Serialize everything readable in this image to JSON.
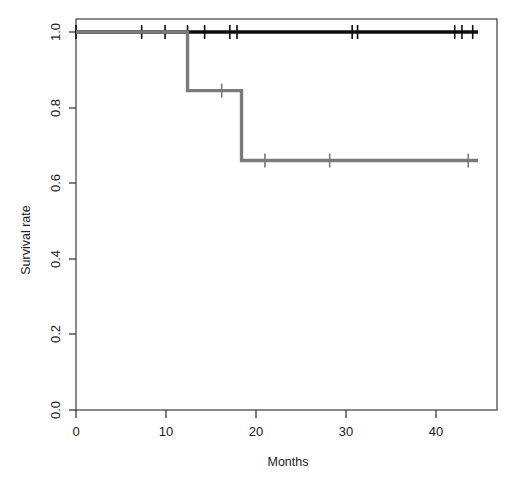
{
  "figure": {
    "background_color": "#ffffff",
    "width": 520,
    "height": 487
  },
  "chart_data": {
    "type": "line",
    "subtype": "kaplan-meier-survival-step",
    "title": "",
    "subtitle": "",
    "xlabel": "Months",
    "ylabel": "Survival rate",
    "xlim": [
      0,
      46.8
    ],
    "ylim": [
      0.0,
      1.0
    ],
    "xticks": [
      0,
      10,
      20,
      30,
      40
    ],
    "xticklabels": [
      "0",
      "10",
      "20",
      "30",
      "40"
    ],
    "yticks": [
      0.0,
      0.2,
      0.4,
      0.6,
      0.8,
      1.0
    ],
    "yticklabels": [
      "0.0",
      "0.2",
      "0.4",
      "0.6",
      "0.8",
      "1.0"
    ],
    "grid": false,
    "legend": "none",
    "frame": "box",
    "series": [
      {
        "name": "Group 1",
        "color": "#0d0d0d",
        "line_width": 3.4,
        "steps": [
          {
            "time": 0.0,
            "survival": 1.0
          },
          {
            "time": 44.7,
            "survival": 1.0
          }
        ],
        "censor_times": [
          0.0,
          7.3,
          9.9,
          12.4,
          14.3,
          17.1,
          17.9,
          30.7,
          31.3,
          42.1,
          42.9,
          44.1
        ],
        "censor_survival": 1.0,
        "n_censored": 12,
        "n_events": 0,
        "final_survival": 1.0
      },
      {
        "name": "Group 2",
        "color": "#7b7b7b",
        "line_width": 3.4,
        "steps": [
          {
            "time": 0.0,
            "survival": 1.0
          },
          {
            "time": 12.4,
            "survival": 1.0
          },
          {
            "time": 12.4,
            "survival": 0.845
          },
          {
            "time": 18.4,
            "survival": 0.845
          },
          {
            "time": 18.4,
            "survival": 0.66
          },
          {
            "time": 44.7,
            "survival": 0.66
          }
        ],
        "censor_times": [
          16.2,
          21.0,
          28.2,
          43.6
        ],
        "censor_survival_at_ticks": [
          0.845,
          0.66,
          0.66,
          0.66
        ],
        "n_censored": 4,
        "n_events": 2,
        "event_times": [
          12.4,
          18.4
        ],
        "final_survival": 0.66
      }
    ]
  }
}
